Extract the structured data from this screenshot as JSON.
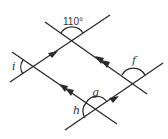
{
  "diagram": {
    "type": "parallel-lines-angles",
    "labels": {
      "top_angle": "110°",
      "i": "i",
      "f": "f",
      "g": "g",
      "h": "h"
    },
    "colors": {
      "line": "#2a2a2a",
      "text": "#333333"
    }
  }
}
